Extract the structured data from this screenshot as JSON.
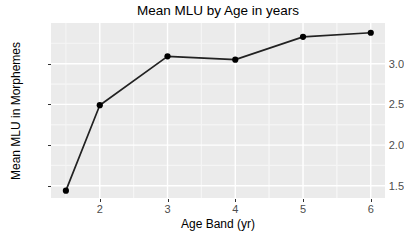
{
  "chart_data": {
    "type": "line",
    "title": "Mean MLU by Age in years",
    "xlabel": "Age Band (yr)",
    "ylabel": "Mean MLU in Morphemes",
    "x": [
      1.5,
      2,
      3,
      4,
      5,
      6
    ],
    "values": [
      1.44,
      2.49,
      3.09,
      3.05,
      3.33,
      3.38
    ],
    "series": [
      {
        "name": "Mean MLU",
        "x": [
          1.5,
          2,
          3,
          4,
          5,
          6
        ],
        "values": [
          1.44,
          2.49,
          3.09,
          3.05,
          3.33,
          3.38
        ]
      }
    ],
    "xlim": [
      1.28,
      6.21
    ],
    "ylim": [
      1.35,
      3.5
    ],
    "xticks": [
      2,
      3,
      4,
      5,
      6
    ],
    "xtick_labels": [
      "2",
      "3",
      "4",
      "5",
      "6"
    ],
    "yticks": [
      1.5,
      2.0,
      2.5,
      3.0
    ],
    "ytick_labels": [
      "1.5",
      "2.0",
      "2.5",
      "3.0"
    ],
    "grid": true,
    "legend": false,
    "legend_position": "none",
    "marker": "circle",
    "colors": {
      "line": "#222222",
      "marker": "#000000",
      "panel_background": "#ebebeb",
      "major_grid": "#ffffff",
      "minor_grid": "#f5f5f5",
      "axis_text": "#4d4d4d",
      "title_text": "#000000",
      "page_background": "#ffffff"
    }
  },
  "geometry": {
    "panel": {
      "left": 51,
      "top": 23,
      "width": 334,
      "height": 175
    }
  }
}
